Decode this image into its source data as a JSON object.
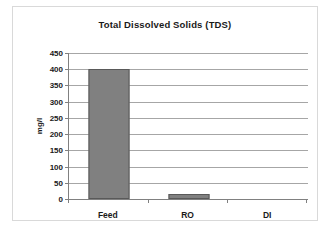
{
  "chart_data": {
    "type": "bar",
    "title": "Total Dissolved Solids (TDS)",
    "xlabel": "",
    "ylabel": "mg/l",
    "categories": [
      "Feed",
      "RO",
      "DI"
    ],
    "values": [
      402,
      15,
      0
    ],
    "series": [
      {
        "name": "TDS",
        "values": [
          402,
          15,
          0
        ]
      }
    ],
    "ylim": [
      0,
      450
    ],
    "yticks": [
      0,
      50,
      100,
      150,
      200,
      250,
      300,
      350,
      400,
      450
    ],
    "ytick_labels": [
      "0",
      "50",
      "100",
      "150",
      "200",
      "250",
      "300",
      "350",
      "400",
      "450"
    ],
    "grid": true,
    "grid_axis": "y",
    "legend": false,
    "legend_position": "none",
    "bar_color": "#808080",
    "bar_border_color": "#595959",
    "gridline_color": "#a6a6a6",
    "axis_color": "#808080",
    "frame_color": "#d9d9d9",
    "text_color": "#1a1a1a"
  }
}
